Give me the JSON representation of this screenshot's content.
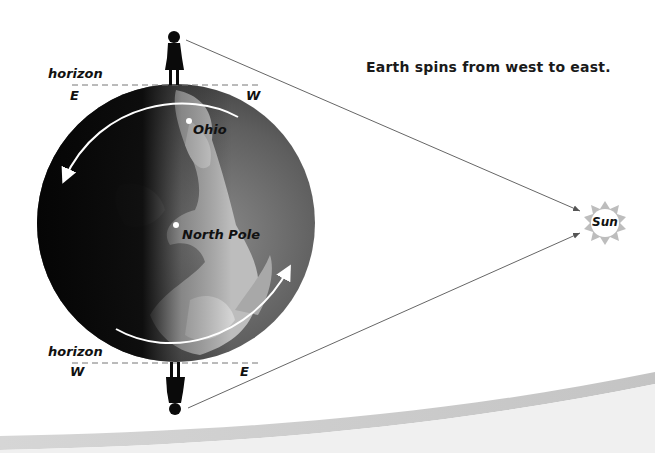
{
  "caption": "Earth spins from west to east.",
  "top_observer": {
    "horizon_label": "horizon",
    "left_direction": "E",
    "right_direction": "W"
  },
  "bottom_observer": {
    "horizon_label": "horizon",
    "left_direction": "W",
    "right_direction": "E"
  },
  "globe": {
    "places": [
      {
        "label": "Ohio"
      },
      {
        "label": "North Pole"
      }
    ],
    "rotation": "counterclockwise"
  },
  "sun": {
    "label": "Sun"
  },
  "colors": {
    "background": "#ffffff",
    "globe_dark": "#111111",
    "globe_mid": "#6a6a6a",
    "globe_light": "#c8c8c8",
    "arrow": "#ffffff",
    "sun_fill": "#bdbdbd",
    "sun_center": "#ffffff",
    "ray_line": "#666666",
    "swoosh": "#cfcfcf"
  }
}
